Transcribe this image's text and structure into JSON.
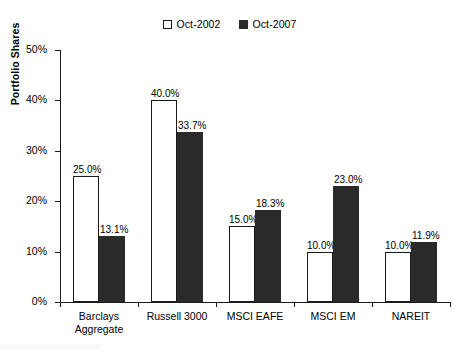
{
  "chart_data": {
    "type": "bar",
    "title": "",
    "xlabel": "",
    "ylabel": "Portfolio Shares",
    "ylim": [
      0,
      50
    ],
    "ytick_labels": [
      "0%",
      "10%",
      "20%",
      "30%",
      "40%",
      "50%"
    ],
    "ytick_values": [
      0,
      10,
      20,
      30,
      40,
      50
    ],
    "grid": false,
    "legend_position": "top-center",
    "categories": [
      "Barclays\nAggregate",
      "Russell 3000",
      "MSCI EAFE",
      "MSCI EM",
      "NAREIT"
    ],
    "series": [
      {
        "name": "Oct-2002",
        "swatch": "hollow",
        "color": "#ffffff",
        "edge_color": "#1a1a1a",
        "values": [
          25.0,
          40.0,
          15.0,
          10.0,
          10.0
        ],
        "labels": [
          "25.0%",
          "40.0%",
          "15.0%",
          "10.0%",
          "10.0%"
        ]
      },
      {
        "name": "Oct-2007",
        "swatch": "filled",
        "color": "#2a2a2a",
        "edge_color": "#2a2a2a",
        "values": [
          13.1,
          33.7,
          18.3,
          23.0,
          11.9
        ],
        "labels": [
          "13.1%",
          "33.7%",
          "18.3%",
          "23.0%",
          "11.9%"
        ]
      }
    ]
  },
  "legend": {
    "items": [
      {
        "label": "Oct-2002"
      },
      {
        "label": "Oct-2007"
      }
    ]
  },
  "axes": {
    "y_title": "Portfolio Shares"
  }
}
